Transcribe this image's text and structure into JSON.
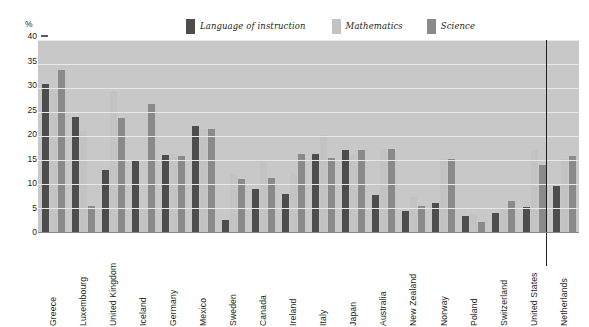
{
  "axis": {
    "unit_label": "%",
    "y_ticks": [
      "40",
      "35",
      "30",
      "25",
      "20",
      "15",
      "10",
      "5",
      "0"
    ]
  },
  "legend": {
    "items": [
      {
        "label": "Language of instruction",
        "color": "#4d4d4d"
      },
      {
        "label": "Mathematics",
        "color": "#c3c3c3"
      },
      {
        "label": "Science",
        "color": "#8a8a8a"
      }
    ]
  },
  "chart_data": {
    "type": "bar",
    "title": "",
    "xlabel": "",
    "ylabel": "%",
    "ylim": [
      0,
      40
    ],
    "ytick_step": 5,
    "grid": true,
    "legend_position": "top",
    "categories": [
      "Greece",
      "Luxembourg",
      "United Kingdom",
      "Iceland",
      "Germany",
      "Mexico",
      "Sweden",
      "Canada",
      "Ireland",
      "Italy",
      "Japan",
      "Australia",
      "New Zealand",
      "Norway",
      "Poland",
      "Switzerland",
      "United States",
      "Netherlands"
    ],
    "series": [
      {
        "name": "Language of instruction",
        "color": "#4d4d4d",
        "values": [
          30.8,
          24.0,
          13.0,
          15.0,
          16.0,
          22.0,
          2.5,
          9.0,
          8.0,
          16.3,
          17.0,
          7.8,
          4.3,
          6.0,
          3.3,
          4.0,
          5.3,
          9.5
        ]
      },
      {
        "name": "Mathematics",
        "color": "#c3c3c3",
        "values": [
          30.0,
          21.0,
          29.3,
          5.0,
          16.3,
          21.5,
          12.0,
          14.7,
          12.0,
          20.3,
          16.0,
          17.3,
          7.3,
          15.5,
          3.8,
          5.0,
          17.0,
          15.3
        ]
      },
      {
        "name": "Science",
        "color": "#8a8a8a",
        "values": [
          33.8,
          5.5,
          23.7,
          26.7,
          15.8,
          21.5,
          11.0,
          11.3,
          16.3,
          15.5,
          17.0,
          17.3,
          5.5,
          15.3,
          2.0,
          6.5,
          14.0,
          15.8
        ]
      }
    ],
    "separator_before_category": "Netherlands"
  }
}
